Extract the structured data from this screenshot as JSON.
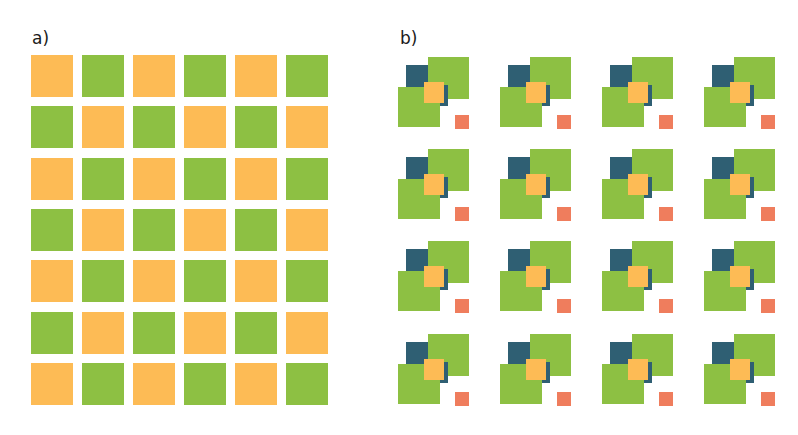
{
  "figure": {
    "title_fragment": "",
    "panel_a": {
      "label": "a)",
      "rows": 7,
      "cols": 6,
      "pattern": "checkerboard",
      "first_cell_color": "orange",
      "origin": [
        31,
        55
      ],
      "pitch": [
        51,
        51.3
      ],
      "cell_size": [
        42,
        42
      ]
    },
    "panel_b": {
      "label": "b)",
      "rows": 4,
      "cols": 4,
      "tile_origins_x": [
        428,
        530,
        632,
        734
      ],
      "tile_origins_y": [
        57,
        149,
        241,
        334
      ],
      "tile_parts": [
        {
          "name": "teal-square-back",
          "color": "teal",
          "x": -22,
          "y": 8,
          "w": 23,
          "h": 22
        },
        {
          "name": "green-square-top-right",
          "color": "green",
          "x": 0,
          "y": 0,
          "w": 41,
          "h": 42
        },
        {
          "name": "teal-square-middle",
          "color": "teal",
          "x": -2,
          "y": 28,
          "w": 22,
          "h": 21
        },
        {
          "name": "green-square-bottom-left",
          "color": "green",
          "x": -30,
          "y": 30,
          "w": 42,
          "h": 40
        },
        {
          "name": "orange-square-center",
          "color": "orange",
          "x": -4,
          "y": 25,
          "w": 20,
          "h": 21
        },
        {
          "name": "red-square-small",
          "color": "red",
          "x": 27,
          "y": 58,
          "w": 14,
          "h": 14
        }
      ]
    },
    "colors": {
      "green": "#8dc043",
      "orange": "#fdbb55",
      "teal": "#2f5f73",
      "red": "#ef7d5d"
    }
  }
}
